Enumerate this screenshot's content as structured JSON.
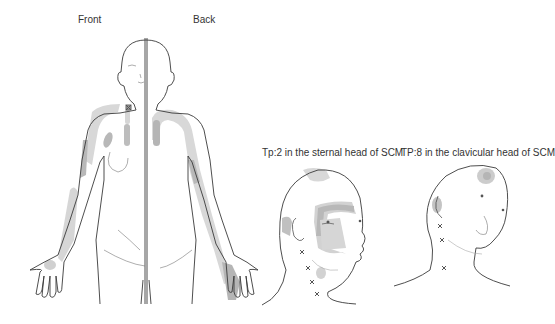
{
  "figure": {
    "body_panel": {
      "front_label": "Front",
      "back_label": "Back"
    },
    "head_panels": [
      {
        "caption": "Tp:2 in the sternal head of SCM",
        "trigger_points": 4
      },
      {
        "caption": "TP:8 in the clavicular head of SCM",
        "trigger_points": 3
      }
    ],
    "colors": {
      "outline": "#3a3a3a",
      "referral_light": "#d6d6d6",
      "referral_dark": "#b0b0b0",
      "trigger_mark": "#666666"
    }
  }
}
